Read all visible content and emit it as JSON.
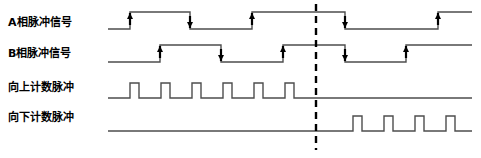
{
  "figure": {
    "type": "timing-diagram",
    "title": "",
    "divider_x": 316,
    "width": 481,
    "height": 158
  },
  "rows": [
    {
      "id": "phase-a",
      "label": "A相脉冲信号",
      "label_x": 8,
      "label_y": 27,
      "baseline_y": 29,
      "high_y": 12,
      "start_x": 108,
      "end_x": 472,
      "edges": [
        {
          "x": 130,
          "dir": "rise"
        },
        {
          "x": 190,
          "dir": "fall"
        },
        {
          "x": 252,
          "dir": "rise"
        },
        {
          "x": 345,
          "dir": "fall"
        },
        {
          "x": 438,
          "dir": "rise"
        }
      ]
    },
    {
      "id": "phase-b",
      "label": "B相脉冲信号",
      "label_x": 8,
      "label_y": 58,
      "baseline_y": 62,
      "high_y": 45,
      "start_x": 108,
      "end_x": 472,
      "edges": [
        {
          "x": 160,
          "dir": "rise"
        },
        {
          "x": 221,
          "dir": "fall"
        },
        {
          "x": 283,
          "dir": "rise"
        },
        {
          "x": 345,
          "dir": "fall"
        },
        {
          "x": 406,
          "dir": "rise"
        }
      ]
    },
    {
      "id": "count-up",
      "label": "向上计数脉冲",
      "label_x": 8,
      "label_y": 92,
      "baseline_y": 98,
      "high_y": 83,
      "start_x": 108,
      "end_x": 472,
      "pulse_width": 9,
      "pulses": [
        130,
        161,
        192,
        223,
        254,
        285
      ]
    },
    {
      "id": "count-down",
      "label": "向下计数脉冲",
      "label_x": 8,
      "label_y": 122,
      "baseline_y": 131,
      "high_y": 116,
      "start_x": 108,
      "end_x": 472,
      "pulse_width": 9,
      "pulses": [
        353,
        384,
        415,
        446
      ]
    }
  ],
  "colors": {
    "line": "#4d4d4d",
    "marker": "#000000",
    "text": "#000000",
    "divider": "#000000",
    "background": "#ffffff"
  }
}
